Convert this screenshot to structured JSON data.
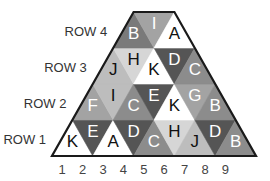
{
  "shades": {
    "white": "#ffffff",
    "very_light": "#d6d6d6",
    "light": "#bdbdbd",
    "mid_light": "#a3a3a3",
    "mid": "#8c8c8c",
    "dark_mid": "#7a7a7a",
    "dark": "#555555",
    "outline": "#1a1a1a"
  },
  "rows": [
    {
      "label": "ROW 1",
      "cells": [
        {
          "letter": "K",
          "shade": "white"
        },
        {
          "letter": "E",
          "shade": "dark"
        },
        {
          "letter": "A",
          "shade": "white"
        },
        {
          "letter": "D",
          "shade": "dark"
        },
        {
          "letter": "C",
          "shade": "mid"
        },
        {
          "letter": "H",
          "shade": "very_light"
        },
        {
          "letter": "J",
          "shade": "light"
        },
        {
          "letter": "D",
          "shade": "dark"
        },
        {
          "letter": "B",
          "shade": "mid"
        }
      ]
    },
    {
      "label": "ROW 2",
      "cells": [
        {
          "letter": "F",
          "shade": "mid_light"
        },
        {
          "letter": "I",
          "shade": "light"
        },
        {
          "letter": "C",
          "shade": "mid"
        },
        {
          "letter": "E",
          "shade": "dark"
        },
        {
          "letter": "K",
          "shade": "white"
        },
        {
          "letter": "G",
          "shade": "mid_light"
        },
        {
          "letter": "B",
          "shade": "mid"
        }
      ]
    },
    {
      "label": "ROW 3",
      "cells": [
        {
          "letter": "J",
          "shade": "light"
        },
        {
          "letter": "H",
          "shade": "very_light"
        },
        {
          "letter": "K",
          "shade": "white"
        },
        {
          "letter": "D",
          "shade": "dark"
        },
        {
          "letter": "C",
          "shade": "mid"
        }
      ]
    },
    {
      "label": "ROW 4",
      "cells": [
        {
          "letter": "B",
          "shade": "dark_mid"
        },
        {
          "letter": "I",
          "shade": "mid_light"
        },
        {
          "letter": "A",
          "shade": "white"
        }
      ]
    }
  ],
  "columns": [
    "1",
    "2",
    "3",
    "4",
    "5",
    "6",
    "7",
    "8",
    "9"
  ]
}
